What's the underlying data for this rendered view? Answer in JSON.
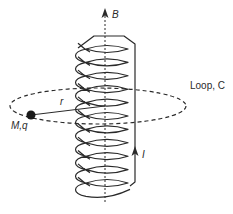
{
  "diagram": {
    "type": "physics-schematic",
    "labels": {
      "field": "B",
      "current": "I",
      "loop": "Loop, C",
      "radius": "r",
      "particle": "M,q"
    },
    "solenoid": {
      "turns": 11,
      "axis_x": 105,
      "top_y": 36,
      "bottom_y": 193
    },
    "loop": {
      "cx": 98,
      "cy": 106,
      "rx": 88,
      "ry": 18,
      "style": "dashed"
    },
    "particle": {
      "x": 31,
      "y": 115,
      "color": "#1a1a1a"
    },
    "colors": {
      "line": "#2a2a2a",
      "background": "#ffffff"
    }
  }
}
